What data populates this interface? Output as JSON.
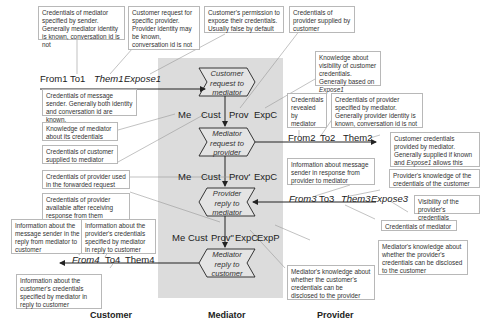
{
  "lanes": {
    "customer": "Customer",
    "mediator": "Mediator",
    "provider": "Provider"
  },
  "steps": [
    {
      "id": "s1",
      "lines": [
        "Customer",
        "request to",
        "mediator"
      ]
    },
    {
      "id": "s2",
      "lines": [
        "Mediator",
        "request to",
        "provider"
      ]
    },
    {
      "id": "s3",
      "lines": [
        "Provider",
        "reply to",
        "mediator"
      ]
    },
    {
      "id": "s4",
      "lines": [
        "Mediator",
        "reply to",
        "customer"
      ]
    }
  ],
  "message_fields": {
    "m1": {
      "from": "From1",
      "to": "To1",
      "them": "Them1",
      "expose": "Expose1"
    },
    "m2": {
      "from": "From2",
      "to": "To2",
      "them": "Them2"
    },
    "m3": {
      "from": "From3",
      "to": "To3",
      "them": "Them3",
      "expose": "Expose3"
    },
    "m4": {
      "from": "From4",
      "to": "To4",
      "them": "Them4"
    }
  },
  "state_fields": {
    "row1": {
      "me": "Me",
      "cust": "Cust",
      "prov": "Prov",
      "expc": "ExpC"
    },
    "row2": {
      "me": "Me",
      "cust": "Cust",
      "prov": "Prov'",
      "expc": "ExpC"
    },
    "row3": {
      "me": "Me",
      "cust": "Cust",
      "prov": "Prov\"",
      "expc": "ExpC",
      "expp": "ExpP"
    }
  },
  "notes": {
    "n_to1": "Credentials of mediator specified by sender. Generally mediator identity is known, conversation id is not",
    "n_them1": "Customer request for specific provider. Provider identity may be known, conversation id is not",
    "n_expose1": "Customer's permission to expose their credentials. Usually false by default",
    "n_prov": "Credentials of provider supplied by customer",
    "n_expc": "Knowledge about visibility of customer credentials. Generally based on",
    "n_expc_it": "Expose1",
    "n_from1": "Credentials of message sender. Generally both identity and conversation id are known.",
    "n_me": "Knowledge of mediator about its credentials",
    "n_cust": "Credentials of customer supplied to mediator",
    "n_from2": "Credentials revealed by mediator",
    "n_to2": "Credentials of provider specified by mediator. Generally provider identity is known, conversation id is not",
    "n_them2_a": "Customer credentials provided by mediator. Generally supplied if known and",
    "n_them2_it": "Expose1",
    "n_them2_b": "allows this",
    "n_provp": "Credentials of provider used in the forwarded request",
    "n_from3": "Information about message sender in response from provider to mediator",
    "n_them3": "Provider's knowledge of the credentials of the customer",
    "n_provpp": "Credentials of provider available after receiving response from them",
    "n_expose3": "Visibility of the provider's credentials",
    "n_to3": "Credentials of mediator",
    "n_from4": "Information about the message sender in the reply from mediator to customer",
    "n_to4": "Information about the provider's credentials specified by mediator in reply to customer",
    "n_expp": "Mediator's knowledge about whether the provider's credentials can be disclosed to the customer",
    "n_them4": "Information about the customer's credentials specified by mediator in reply to customer",
    "n_expc2": "Mediator's knowledge about whether the customer's credentials can be disclosed to the provider"
  },
  "colors": {
    "panel": "#dcdcdc",
    "note_border": "#b8b8b8",
    "arrow": "#222222"
  }
}
